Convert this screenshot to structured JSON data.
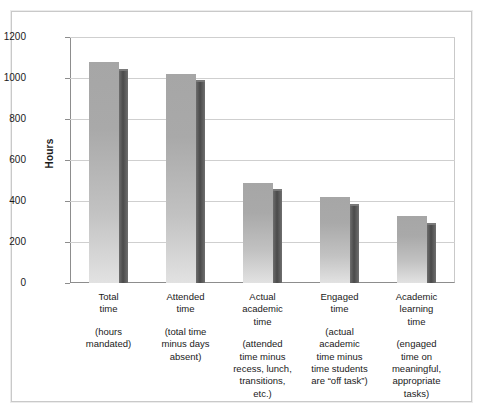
{
  "chart_data": {
    "type": "bar",
    "title": "",
    "subtitle": "",
    "xlabel": "",
    "ylabel": "Hours",
    "ylim": [
      0,
      1200
    ],
    "ytick_values": [
      1200,
      1000,
      800,
      600,
      400,
      200,
      0
    ],
    "ytick_labels": [
      "1200",
      "1000",
      "800",
      "600",
      "400",
      "200",
      "0"
    ],
    "grid": true,
    "legend": "none",
    "categories": [
      "Total\ntime",
      "Attended\ntime",
      "Actual\nacademic\ntime",
      "Engaged\ntime",
      "Academic\nlearning\ntime"
    ],
    "category_descriptions": [
      "(hours\nmandated)",
      "(total time\nminus days\nabsent)",
      "(attended\ntime minus\nrecess, lunch,\ntransitions,\netc.)",
      "(actual\nacademic\ntime minus\ntime students\nare “off task”)",
      "(engaged\ntime on\nmeaningful,\nappropriate\ntasks)"
    ],
    "values": [
      1080,
      1020,
      490,
      420,
      325
    ],
    "shadow_values": [
      1035,
      980,
      450,
      375,
      285
    ],
    "colors": {
      "bar_face_top": "#a6a6a6",
      "bar_face_bottom": "#e2e2e2",
      "bar_side": "#4a4a4a",
      "gridline": "#cfcfcf",
      "axis": "#8d8d8d",
      "frame": "#c9c9c9",
      "text": "#1a1a1a",
      "background": "#ffffff"
    }
  },
  "axis": {
    "y_title": "Hours",
    "ticks": [
      {
        "label": "1200",
        "value": 1200
      },
      {
        "label": "1000",
        "value": 1000
      },
      {
        "label": "800",
        "value": 800
      },
      {
        "label": "600",
        "value": 600
      },
      {
        "label": "400",
        "value": 400
      },
      {
        "label": "200",
        "value": 200
      },
      {
        "label": "0",
        "value": 0
      }
    ]
  }
}
